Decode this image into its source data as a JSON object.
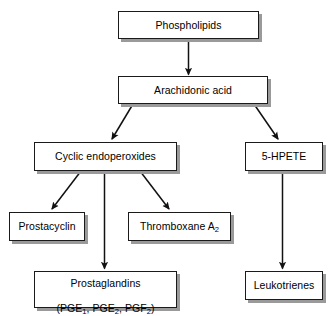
{
  "diagram": {
    "style": {
      "box_fill": "#ffffff",
      "box_border": "#1a1a1a",
      "box_shadow": "#9a9a9a",
      "arrow_color": "#111111",
      "background": "#ffffff"
    },
    "nodes": [
      {
        "id": "phospholipids",
        "label": "Phospholipids",
        "x": 118,
        "y": 11,
        "w": 141,
        "h": 28
      },
      {
        "id": "arachidonic-acid",
        "label": "Arachidonic acid",
        "x": 118,
        "y": 76,
        "w": 150,
        "h": 28
      },
      {
        "id": "cyclic-endoperoxides",
        "label": "Cyclic endoperoxides",
        "x": 34,
        "y": 142,
        "w": 143,
        "h": 29
      },
      {
        "id": "5-hpete",
        "label": "5-HPETE",
        "x": 245,
        "y": 142,
        "w": 78,
        "h": 29
      },
      {
        "id": "prostacyclin",
        "label": "Prostacyclin",
        "x": 9,
        "y": 212,
        "w": 76,
        "h": 29
      },
      {
        "id": "thromboxane-a2",
        "label": "Thromboxane A2",
        "label_main": "Thromboxane A",
        "label_sub": "2",
        "x": 128,
        "y": 212,
        "w": 103,
        "h": 29
      },
      {
        "id": "prostaglandins",
        "label": "Prostaglandins (PGE1, PGE2, PGF2)",
        "line1": "Prostaglandins",
        "line2_parts": [
          {
            "t": "(PGE"
          },
          {
            "sub": "1"
          },
          {
            "t": ", PGE"
          },
          {
            "sub": "2"
          },
          {
            "t": ", PGF"
          },
          {
            "sub": "2"
          },
          {
            "t": ")"
          }
        ],
        "x": 34,
        "y": 271,
        "w": 143,
        "h": 37
      },
      {
        "id": "leukotrienes",
        "label": "Leukotrienes",
        "x": 245,
        "y": 271,
        "w": 78,
        "h": 29
      }
    ],
    "edges": [
      {
        "id": "phospholipids-to-arachidonic-acid",
        "from": "phospholipids",
        "to": "arachidonic-acid",
        "kind": "vertical"
      },
      {
        "id": "arachidonic-acid-to-cyclic-endoperoxides",
        "from": "arachidonic-acid",
        "to": "cyclic-endoperoxides",
        "kind": "diagonal-left"
      },
      {
        "id": "arachidonic-acid-to-5-hpete",
        "from": "arachidonic-acid",
        "to": "5-hpete",
        "kind": "diagonal-right"
      },
      {
        "id": "cyclic-endoperoxides-to-prostacyclin",
        "from": "cyclic-endoperoxides",
        "to": "prostacyclin",
        "kind": "diagonal-left"
      },
      {
        "id": "cyclic-endoperoxides-to-prostaglandins",
        "from": "cyclic-endoperoxides",
        "to": "prostaglandins",
        "kind": "vertical"
      },
      {
        "id": "cyclic-endoperoxides-to-thromboxane-a2",
        "from": "cyclic-endoperoxides",
        "to": "thromboxane-a2",
        "kind": "diagonal-right"
      },
      {
        "id": "5-hpete-to-leukotrienes",
        "from": "5-hpete",
        "to": "leukotrienes",
        "kind": "vertical"
      }
    ]
  }
}
